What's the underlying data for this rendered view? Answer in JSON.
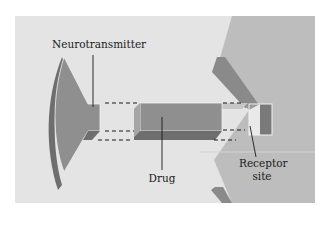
{
  "diagram": {
    "type": "mechanism illustration",
    "labels": {
      "neurotransmitter": "Neurotransmitter",
      "drug": "Drug",
      "receptor_line1": "Receptor",
      "receptor_line2": "site"
    },
    "colors": {
      "background": "#e6e6e6",
      "panel": "#e4e4e4",
      "postsynaptic": "#bdbdbd",
      "shape_fill": "#8f8f8f",
      "shape_dark": "#707070",
      "shape_light": "#a8a8a8",
      "outline_light": "#f2f2f2",
      "dashed": "#1a1a1a"
    }
  }
}
